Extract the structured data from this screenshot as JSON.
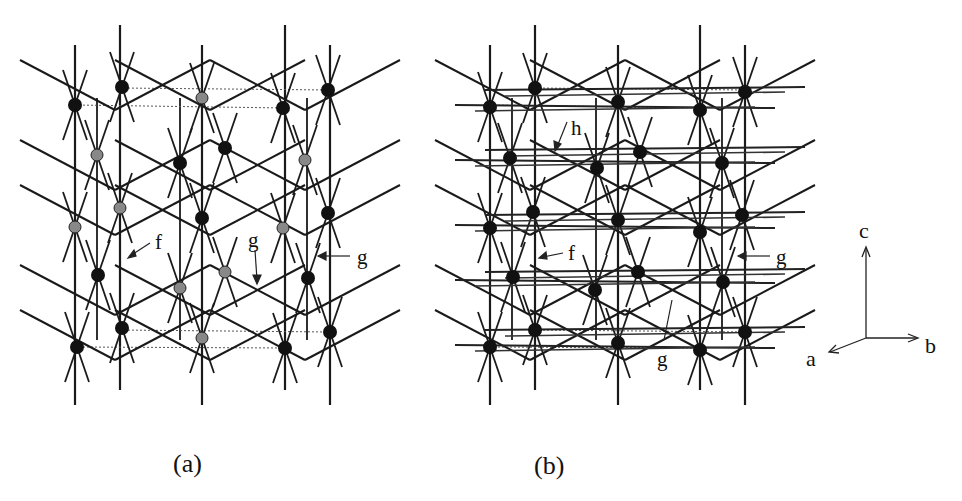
{
  "figure": {
    "panels": [
      {
        "id": "a",
        "caption": "(a)",
        "labels": [
          {
            "text": "f",
            "x": 143,
            "y": 246
          },
          {
            "text": "g",
            "x": 248,
            "y": 245
          },
          {
            "text": "g",
            "x": 357,
            "y": 262
          }
        ],
        "columns_x": [
          75,
          120,
          202,
          285,
          330
        ],
        "dark_nodes": [
          [
            75,
            105
          ],
          [
            122,
            87
          ],
          [
            283,
            108
          ],
          [
            328,
            90
          ],
          [
            180,
            163
          ],
          [
            225,
            148
          ],
          [
            202,
            218
          ],
          [
            328,
            213
          ],
          [
            98,
            275
          ],
          [
            308,
            278
          ],
          [
            122,
            328
          ],
          [
            77,
            347
          ],
          [
            285,
            348
          ],
          [
            330,
            332
          ]
        ],
        "light_nodes": [
          [
            202,
            98
          ],
          [
            97,
            155
          ],
          [
            305,
            160
          ],
          [
            120,
            208
          ],
          [
            75,
            227
          ],
          [
            283,
            228
          ],
          [
            180,
            288
          ],
          [
            225,
            272
          ],
          [
            202,
            338
          ]
        ]
      },
      {
        "id": "b",
        "caption": "(b)",
        "labels": [
          {
            "text": "h",
            "x": 568,
            "y": 133
          },
          {
            "text": "f",
            "x": 568,
            "y": 258
          },
          {
            "text": "g",
            "x": 775,
            "y": 262
          },
          {
            "text": "g",
            "x": 657,
            "y": 365
          }
        ],
        "columns_x": [
          490,
          535,
          618,
          700,
          745
        ],
        "dark_nodes": [
          [
            490,
            107
          ],
          [
            535,
            88
          ],
          [
            618,
            102
          ],
          [
            700,
            110
          ],
          [
            745,
            92
          ],
          [
            510,
            158
          ],
          [
            597,
            168
          ],
          [
            640,
            152
          ],
          [
            722,
            163
          ],
          [
            490,
            228
          ],
          [
            533,
            212
          ],
          [
            618,
            220
          ],
          [
            700,
            232
          ],
          [
            742,
            215
          ],
          [
            513,
            277
          ],
          [
            595,
            290
          ],
          [
            638,
            272
          ],
          [
            723,
            282
          ],
          [
            535,
            330
          ],
          [
            490,
            347
          ],
          [
            618,
            343
          ],
          [
            700,
            350
          ],
          [
            745,
            332
          ]
        ],
        "light_nodes": []
      }
    ],
    "axes": {
      "c_label": "c",
      "b_label": "b",
      "a_label": "a"
    }
  }
}
